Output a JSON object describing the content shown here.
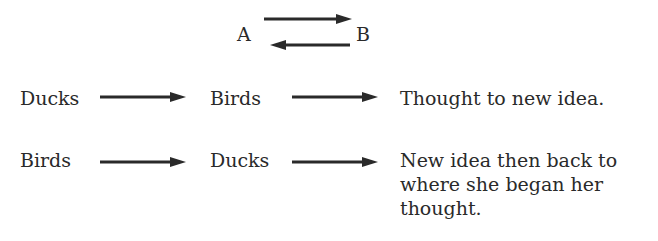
{
  "top": {
    "left": "A",
    "right": "B"
  },
  "rows": [
    {
      "from": "Ducks",
      "to": "Birds",
      "result": "Thought to new idea."
    },
    {
      "from": "Birds",
      "to": "Ducks",
      "result": "New idea then back to where she began her thought."
    }
  ],
  "colors": {
    "ink": "#2a2a2a",
    "background": "#ffffff"
  }
}
